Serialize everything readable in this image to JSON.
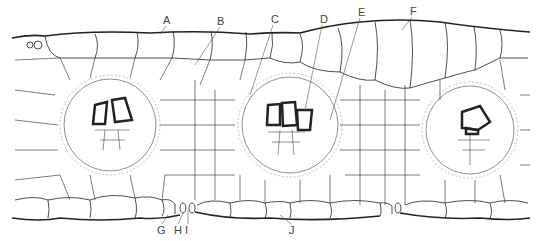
{
  "figure": {
    "type": "botanical cross-section illustration (grass leaf transverse section)",
    "background": "#ffffff",
    "line_color": "#222222",
    "labels": [
      {
        "id": "A",
        "text": "A",
        "x": 163,
        "y": 15
      },
      {
        "id": "B",
        "text": "B",
        "x": 217,
        "y": 16
      },
      {
        "id": "C",
        "text": "C",
        "x": 271,
        "y": 14
      },
      {
        "id": "D",
        "text": "D",
        "x": 320,
        "y": 14
      },
      {
        "id": "E",
        "text": "E",
        "x": 358,
        "y": 7
      },
      {
        "id": "F",
        "text": "F",
        "x": 410,
        "y": 6
      },
      {
        "id": "G",
        "text": "G",
        "x": 157,
        "y": 225
      },
      {
        "id": "H",
        "text": "H",
        "x": 174,
        "y": 225
      },
      {
        "id": "I",
        "text": "I",
        "x": 185,
        "y": 225
      },
      {
        "id": "J",
        "text": "J",
        "x": 289,
        "y": 225
      }
    ],
    "vascular_bundles": [
      {
        "name": "bundle-left",
        "cx": 110,
        "cy": 125,
        "r": 50
      },
      {
        "name": "bundle-center",
        "cx": 290,
        "cy": 125,
        "r": 52
      },
      {
        "name": "bundle-right",
        "cx": 470,
        "cy": 130,
        "r": 48
      }
    ]
  }
}
